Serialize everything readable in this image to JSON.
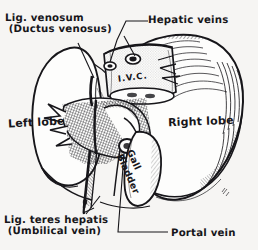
{
  "figure": {
    "domain": "anatomical-illustration",
    "style": "pen-and-ink engraving with cross-hatching and stipple",
    "background_color": "#f6f5f3",
    "ink_color": "#17161a",
    "width": 258,
    "height": 250
  },
  "labels": {
    "lig_venosum": "Lig. venosum\n (Ductus venosus)",
    "hepatic_veins": "Hepatic veins",
    "left_lobe": "Left lobe",
    "right_lobe": "Right lobe",
    "ivc": "I.V.C.",
    "gall_bladder": "Gall\nBladder",
    "lig_teres": "Lig. teres hepatis\n (Umbilical vein)",
    "portal_vein": "Portal vein"
  },
  "structures": [
    {
      "name": "left-lobe",
      "label": "Left lobe",
      "position": "left",
      "shading": "outline-only"
    },
    {
      "name": "right-lobe",
      "label": "Right lobe",
      "position": "right",
      "shading": "parallel-hatching-superior-border"
    },
    {
      "name": "inferior-vena-cava",
      "label": "I.V.C.",
      "position": "upper-center",
      "shading": "stipple-cylinder"
    },
    {
      "name": "hepatic-veins",
      "label": "Hepatic veins",
      "position": "upper-center",
      "detail": "two ostia openings on IVC"
    },
    {
      "name": "gall-bladder",
      "label": "Gall Bladder",
      "position": "lower-center-right",
      "shading": "outline-with-hatching"
    },
    {
      "name": "porta-hepatis",
      "label": "",
      "position": "center",
      "shading": "dense-cross-hatching"
    },
    {
      "name": "portal-vein",
      "label": "Portal vein",
      "position": "center-below-porta"
    },
    {
      "name": "ligamentum-venosum",
      "label": "Lig. venosum (Ductus venosus)",
      "position": "upper-left-fissure"
    },
    {
      "name": "ligamentum-teres-hepatis",
      "label": "Lig. teres hepatis (Umbilical vein)",
      "position": "lower-left-fissure"
    }
  ],
  "leader_lines": [
    {
      "from": "lig_venosum",
      "to": "upper-left-fissure",
      "style": "straight-diagonal"
    },
    {
      "from": "hepatic_veins",
      "to": "ivc-ostia",
      "style": "forked-two-branch"
    },
    {
      "from": "lig_teres",
      "to": "lower-fissure-strip",
      "style": "straight-diagonal"
    },
    {
      "from": "portal_vein",
      "to": "porta-hepatis",
      "style": "long-horizontal-then-diagonal"
    }
  ],
  "signature": {
    "present": true,
    "position": "bottom-right-liver-margin"
  }
}
